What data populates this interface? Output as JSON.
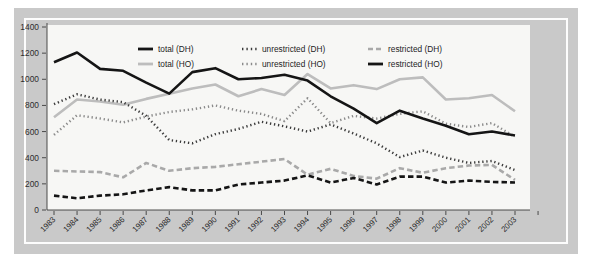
{
  "figure": {
    "frame_color": "#c9c9c9",
    "inset_rule_color": "#fdfdfd",
    "plot_background": "#f7f7f5"
  },
  "chart_data": {
    "type": "line",
    "title": "",
    "subtitle": "",
    "xlabel": "",
    "ylabel": "",
    "xlim": [
      1983,
      2003
    ],
    "ylim": [
      0,
      1400
    ],
    "yticks": [
      0,
      200,
      400,
      600,
      800,
      1000,
      1200,
      1400
    ],
    "grid": false,
    "legend_position": "top-center",
    "categories": [
      "1983",
      "1984",
      "1985",
      "1986",
      "1987",
      "1988",
      "1989",
      "1990",
      "1991",
      "1992",
      "1993",
      "1994",
      "1995",
      "1996",
      "1997",
      "1998",
      "1999",
      "2000",
      "2001",
      "2002",
      "2003"
    ],
    "series": [
      {
        "name": "total (DH)",
        "color": "#151515",
        "style": "solid",
        "width": 2.6,
        "values": [
          1130,
          1205,
          1080,
          1065,
          975,
          890,
          1055,
          1085,
          1000,
          1010,
          1035,
          990,
          870,
          775,
          665,
          760,
          700,
          645,
          580,
          600,
          570
        ]
      },
      {
        "name": "unrestricted (DH)",
        "color": "#3a3a3a",
        "style": "dotted",
        "width": 2.4,
        "values": [
          810,
          885,
          845,
          825,
          720,
          535,
          510,
          580,
          620,
          675,
          640,
          600,
          655,
          585,
          510,
          405,
          455,
          400,
          360,
          375,
          305
        ]
      },
      {
        "name": "restricted (DH)",
        "color": "#a9a9a9",
        "style": "dashed",
        "width": 2.6,
        "values": [
          300,
          295,
          290,
          250,
          360,
          300,
          320,
          330,
          350,
          370,
          390,
          270,
          315,
          260,
          240,
          320,
          285,
          320,
          340,
          345,
          230
        ]
      },
      {
        "name": "total (HO)",
        "color": "#bdbdbd",
        "style": "solid",
        "width": 2.6,
        "values": [
          710,
          845,
          830,
          805,
          850,
          890,
          930,
          960,
          870,
          925,
          880,
          1040,
          930,
          955,
          925,
          1000,
          1015,
          845,
          855,
          880,
          755
        ]
      },
      {
        "name": "unrestricted (HO)",
        "color": "#8a8a8a",
        "style": "dotted",
        "width": 2.4,
        "values": [
          575,
          725,
          700,
          670,
          715,
          750,
          770,
          800,
          760,
          735,
          680,
          855,
          665,
          720,
          700,
          735,
          755,
          660,
          635,
          665,
          560
        ]
      },
      {
        "name": "restricted (HO)",
        "color": "#151515",
        "style": "dashed",
        "width": 2.6,
        "values": [
          110,
          90,
          110,
          120,
          150,
          175,
          150,
          150,
          195,
          210,
          225,
          265,
          210,
          245,
          195,
          255,
          255,
          210,
          225,
          215,
          210
        ]
      }
    ],
    "legend": [
      {
        "label": "total (DH)",
        "color": "#151515",
        "style": "solid"
      },
      {
        "label": "unrestricted (DH)",
        "color": "#3a3a3a",
        "style": "dotted"
      },
      {
        "label": "restricted (DH)",
        "color": "#a9a9a9",
        "style": "dashed"
      },
      {
        "label": "total (HO)",
        "color": "#bdbdbd",
        "style": "solid"
      },
      {
        "label": "unrestricted (HO)",
        "color": "#8a8a8a",
        "style": "dotted"
      },
      {
        "label": "restricted (HO)",
        "color": "#151515",
        "style": "solid"
      }
    ]
  }
}
